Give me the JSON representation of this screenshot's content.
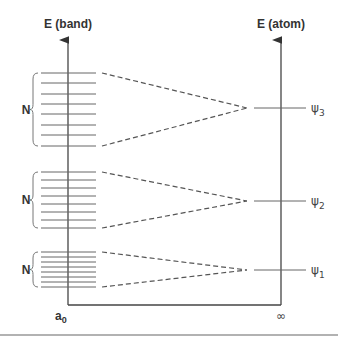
{
  "diagram": {
    "left_axis_label": "E (band)",
    "right_axis_label": "E (atom)",
    "x_left_label": "a",
    "x_left_sub": "0",
    "x_right_label": "∞",
    "bands": [
      {
        "count_label": "N",
        "levels": [
          73,
          83,
          94,
          104,
          114,
          125,
          135,
          146
        ],
        "atomic_level": {
          "symbol": "ψ",
          "sub": "3",
          "y": 108
        }
      },
      {
        "count_label": "N",
        "levels": [
          172,
          180,
          188,
          196,
          204,
          212,
          220,
          228
        ],
        "atomic_level": {
          "symbol": "ψ",
          "sub": "2",
          "y": 201
        }
      },
      {
        "count_label": "N",
        "levels": [
          252,
          257,
          262,
          267,
          272,
          277,
          282,
          287
        ],
        "atomic_level": {
          "symbol": "ψ",
          "sub": "1",
          "y": 270
        }
      }
    ],
    "colors": {
      "axis": "#444444",
      "level": "#666666",
      "dash": "#555555"
    }
  }
}
